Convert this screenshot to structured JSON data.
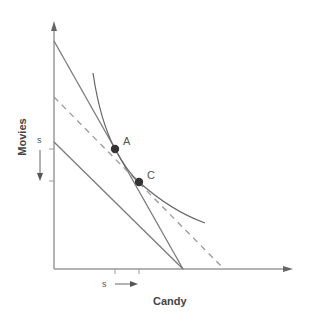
{
  "diagram": {
    "x_axis_label": "Candy",
    "y_axis_label": "Movies",
    "points": [
      {
        "label": "A",
        "x": 115,
        "y": 149
      },
      {
        "label": "C",
        "x": 139,
        "y": 182
      }
    ],
    "shift_labels": {
      "y_shift": "s",
      "x_shift": "s"
    },
    "lines": [
      {
        "name": "original-budget-line",
        "style": "solid"
      },
      {
        "name": "new-budget-line",
        "style": "solid"
      },
      {
        "name": "compensated-budget-line",
        "style": "dashed"
      }
    ],
    "curves": [
      {
        "name": "indifference-curve",
        "style": "solid"
      }
    ],
    "colors": {
      "line": "#7a7a7a",
      "point": "#333333",
      "axis": "#9a9a9a"
    }
  }
}
